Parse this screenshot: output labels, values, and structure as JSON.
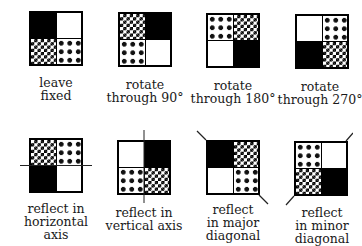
{
  "figures": [
    {
      "id": "leave-fixed",
      "label_lines": [
        "leave",
        "fixed"
      ],
      "quadrants": [
        "black",
        "white",
        "checker",
        "diamond"
      ],
      "axis": "none"
    },
    {
      "id": "rotate-90",
      "label_lines": [
        "rotate",
        "through 90°"
      ],
      "quadrants": [
        "checker",
        "black",
        "diamond",
        "white"
      ],
      "axis": "none"
    },
    {
      "id": "rotate-180",
      "label_lines": [
        "rotate",
        "through 180°"
      ],
      "quadrants": [
        "diamond",
        "checker",
        "white",
        "black"
      ],
      "axis": "none"
    },
    {
      "id": "rotate-270",
      "label_lines": [
        "rotate",
        "through 270°"
      ],
      "quadrants": [
        "white",
        "diamond",
        "black",
        "checker"
      ],
      "axis": "none"
    },
    {
      "id": "reflect-horizontal",
      "label_lines": [
        "reflect in",
        "horizontal",
        "axis"
      ],
      "quadrants": [
        "checker",
        "diamond",
        "black",
        "white"
      ],
      "axis": "horizontal"
    },
    {
      "id": "reflect-vertical",
      "label_lines": [
        "reflect in",
        "vertical axis"
      ],
      "quadrants": [
        "white",
        "black",
        "diamond",
        "checker"
      ],
      "axis": "vertical"
    },
    {
      "id": "reflect-major-diagonal",
      "label_lines": [
        "reflect",
        "in major",
        "diagonal"
      ],
      "quadrants": [
        "black",
        "checker",
        "white",
        "diamond"
      ],
      "axis": "major-diagonal"
    },
    {
      "id": "reflect-minor-diagonal",
      "label_lines": [
        "reflect",
        "in minor",
        "diagonal"
      ],
      "quadrants": [
        "diamond",
        "white",
        "checker",
        "black"
      ],
      "axis": "minor-diagonal"
    }
  ],
  "colors": {
    "ink": "#000000",
    "background": "#ffffff"
  }
}
